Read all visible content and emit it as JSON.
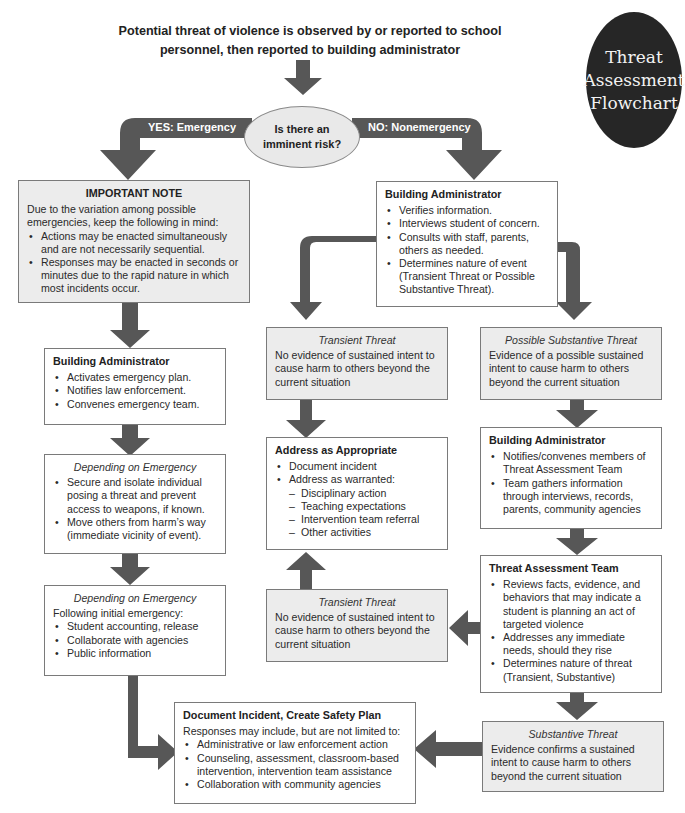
{
  "badge": {
    "line1": "Threat",
    "line2": "Assessment",
    "line3": "Flowchart"
  },
  "header": {
    "text": "Potential threat of violence is observed by or reported to school personnel, then reported to building administrator"
  },
  "decision": {
    "question": "Is there an imminent risk?",
    "yes_label": "YES: Emergency",
    "no_label": "NO: Nonemergency"
  },
  "colors": {
    "arrow": "#575757",
    "box_border": "#7a7a7a",
    "shaded_box": "#ececec",
    "badge": "#262626"
  },
  "emergency": {
    "important_note": {
      "title": "IMPORTANT NOTE",
      "intro": "Due to the variation among possible emergencies, keep the following in mind:",
      "items": [
        "Actions may be enacted simultaneously and are not necessarily sequential.",
        "Responses may be enacted in seconds or minutes due to the rapid nature in which most incidents occur."
      ]
    },
    "building_admin": {
      "title": "Building Administrator",
      "items": [
        "Activates emergency plan.",
        "Notifies law enforcement.",
        "Convenes emergency team."
      ]
    },
    "depending_1": {
      "title": "Depending on Emergency",
      "items": [
        "Secure and isolate individual posing a threat and prevent access to weapons, if known.",
        "Move others from harm’s way (immediate vicinity of event)."
      ]
    },
    "depending_2": {
      "title": "Depending on Emergency",
      "intro": "Following initial emergency:",
      "items": [
        "Student accounting, release",
        "Collaborate with agencies",
        "Public information"
      ]
    }
  },
  "nonemergency": {
    "building_admin": {
      "title": "Building Administrator",
      "items": [
        "Verifies information.",
        "Interviews student of concern.",
        "Consults with staff, parents, others as needed.",
        "Determines nature of event (Transient Threat or Possible Substantive Threat)."
      ]
    },
    "transient_1": {
      "title": "Transient Threat",
      "text": "No evidence of sustained intent to cause harm to others beyond the current situation"
    },
    "possible_substantive": {
      "title": "Possible Substantive Threat",
      "text": "Evidence of a possible sustained intent to cause harm to others beyond the current situation"
    },
    "address": {
      "title": "Address as Appropriate",
      "items": [
        "Document incident",
        "Address as warranted:"
      ],
      "subitems": [
        "Disciplinary action",
        "Teaching expectations",
        "Intervention team referral",
        "Other activities"
      ]
    },
    "building_admin_2": {
      "title": "Building Administrator",
      "items": [
        "Notifies/convenes members of Threat Assessment Team",
        "Team gathers information through interviews, records, parents, community agencies"
      ]
    },
    "threat_team": {
      "title": "Threat Assessment Team",
      "items": [
        "Reviews facts, evidence, and behaviors that may indicate a student is planning an act of targeted violence",
        "Addresses any immediate needs, should they rise",
        "Determines nature of threat (Transient, Substantive)"
      ]
    },
    "transient_2": {
      "title": "Transient Threat",
      "text": "No evidence of sustained intent to cause harm to others beyond the current situation"
    },
    "substantive": {
      "title": "Substantive Threat",
      "text": "Evidence confirms a sustained intent to cause harm to others beyond the current situation"
    }
  },
  "safety_plan": {
    "title": "Document Incident, Create Safety Plan",
    "intro": "Responses may include, but are not limited to:",
    "items": [
      "Administrative or law enforcement action",
      "Counseling, assessment, classroom-based intervention, intervention team assistance",
      "Collaboration with community agencies"
    ]
  }
}
